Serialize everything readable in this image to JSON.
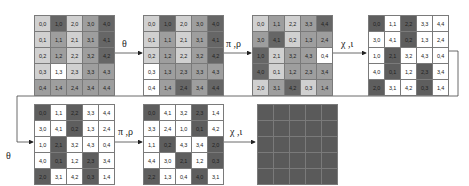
{
  "diagram": {
    "arrows": [
      {
        "label": "θ"
      },
      {
        "label": "π ,ρ"
      },
      {
        "label": "χ ,ι"
      },
      {
        "label": "θ"
      },
      {
        "label": "π ,ρ"
      },
      {
        "label": "χ ,ι"
      }
    ],
    "grids": [
      {
        "name": "state-initial",
        "cells": [
          [
            {
              "t": "0,0",
              "s": "l"
            },
            {
              "t": "1,0",
              "s": "d"
            },
            {
              "t": "2,0",
              "s": "l"
            },
            {
              "t": "3,0",
              "s": "m"
            },
            {
              "t": "4,0",
              "s": "d"
            }
          ],
          [
            {
              "t": "0,1",
              "s": "l"
            },
            {
              "t": "1,1",
              "s": "m"
            },
            {
              "t": "2,1",
              "s": "l"
            },
            {
              "t": "3,1",
              "s": "m"
            },
            {
              "t": "4,1",
              "s": "d"
            }
          ],
          [
            {
              "t": "0,2",
              "s": "l"
            },
            {
              "t": "1,2",
              "s": "m"
            },
            {
              "t": "2,2",
              "s": "l"
            },
            {
              "t": "3,2",
              "s": "m"
            },
            {
              "t": "4,2",
              "s": "d"
            }
          ],
          [
            {
              "t": "0,3",
              "s": "l"
            },
            {
              "t": "1,3",
              "s": "w"
            },
            {
              "t": "2,3",
              "s": "l"
            },
            {
              "t": "3,3",
              "s": "m"
            },
            {
              "t": "4,3",
              "s": "m"
            }
          ],
          [
            {
              "t": "0,4",
              "s": "m"
            },
            {
              "t": "1,4",
              "s": "m"
            },
            {
              "t": "2,4",
              "s": "m"
            },
            {
              "t": "3,4",
              "s": "m"
            },
            {
              "t": "4,4",
              "s": "m"
            }
          ]
        ]
      },
      {
        "name": "state-after-theta",
        "cells": [
          [
            {
              "t": "0,0",
              "s": "l"
            },
            {
              "t": "1,0",
              "s": "d"
            },
            {
              "t": "2,0",
              "s": "l"
            },
            {
              "t": "3,0",
              "s": "m"
            },
            {
              "t": "4,0",
              "s": "d"
            }
          ],
          [
            {
              "t": "0,1",
              "s": "l"
            },
            {
              "t": "1,1",
              "s": "m"
            },
            {
              "t": "2,1",
              "s": "l"
            },
            {
              "t": "3,1",
              "s": "m"
            },
            {
              "t": "4,1",
              "s": "d"
            }
          ],
          [
            {
              "t": "0,2",
              "s": "l"
            },
            {
              "t": "1,2",
              "s": "m"
            },
            {
              "t": "2,2",
              "s": "l"
            },
            {
              "t": "3,2",
              "s": "m"
            },
            {
              "t": "4,2",
              "s": "d"
            }
          ],
          [
            {
              "t": "0,3",
              "s": "w"
            },
            {
              "t": "1,3",
              "s": "m"
            },
            {
              "t": "2,3",
              "s": "m"
            },
            {
              "t": "3,3",
              "s": "m"
            },
            {
              "t": "4,3",
              "s": "m"
            }
          ],
          [
            {
              "t": "0,4",
              "s": "w"
            },
            {
              "t": "1,4",
              "s": "m"
            },
            {
              "t": "2,4",
              "s": "d"
            },
            {
              "t": "3,4",
              "s": "m"
            },
            {
              "t": "4,4",
              "s": "d"
            }
          ]
        ]
      },
      {
        "name": "state-after-pi-rho",
        "cells": [
          [
            {
              "t": "0,0",
              "s": "l"
            },
            {
              "t": "1,1",
              "s": "m"
            },
            {
              "t": "2,2",
              "s": "l"
            },
            {
              "t": "3,3",
              "s": "m"
            },
            {
              "t": "4,4",
              "s": "d"
            }
          ],
          [
            {
              "t": "3,0",
              "s": "m"
            },
            {
              "t": "4,1",
              "s": "d"
            },
            {
              "t": "0,2",
              "s": "l"
            },
            {
              "t": "1,3",
              "s": "m"
            },
            {
              "t": "2,4",
              "s": "m"
            }
          ],
          [
            {
              "t": "1,0",
              "s": "d"
            },
            {
              "t": "2,1",
              "s": "l"
            },
            {
              "t": "3,2",
              "s": "m"
            },
            {
              "t": "4,3",
              "s": "m"
            },
            {
              "t": "0,4",
              "s": "w"
            }
          ],
          [
            {
              "t": "4,0",
              "s": "d"
            },
            {
              "t": "0,1",
              "s": "l"
            },
            {
              "t": "1,2",
              "s": "m"
            },
            {
              "t": "2,3",
              "s": "m"
            },
            {
              "t": "3,4",
              "s": "m"
            }
          ],
          [
            {
              "t": "2,0",
              "s": "l"
            },
            {
              "t": "3,1",
              "s": "m"
            },
            {
              "t": "4,2",
              "s": "d"
            },
            {
              "t": "0,3",
              "s": "l"
            },
            {
              "t": "1,4",
              "s": "m"
            }
          ]
        ]
      },
      {
        "name": "state-after-chi-iota",
        "cells": [
          [
            {
              "t": "0,0",
              "s": "k"
            },
            {
              "t": "1,1",
              "s": "w"
            },
            {
              "t": "2,2",
              "s": "k"
            },
            {
              "t": "3,3",
              "s": "w"
            },
            {
              "t": "4,4",
              "s": "w"
            }
          ],
          [
            {
              "t": "3,0",
              "s": "w"
            },
            {
              "t": "4,1",
              "s": "w"
            },
            {
              "t": "0,2",
              "s": "k"
            },
            {
              "t": "1,3",
              "s": "w"
            },
            {
              "t": "2,4",
              "s": "w"
            }
          ],
          [
            {
              "t": "1,0",
              "s": "w"
            },
            {
              "t": "2,1",
              "s": "k"
            },
            {
              "t": "3,2",
              "s": "w"
            },
            {
              "t": "4,3",
              "s": "w"
            },
            {
              "t": "0,4",
              "s": "w"
            }
          ],
          [
            {
              "t": "4,0",
              "s": "w"
            },
            {
              "t": "0,1",
              "s": "k"
            },
            {
              "t": "1,2",
              "s": "w"
            },
            {
              "t": "2,3",
              "s": "k"
            },
            {
              "t": "3,4",
              "s": "w"
            }
          ],
          [
            {
              "t": "2,0",
              "s": "k"
            },
            {
              "t": "3,1",
              "s": "w"
            },
            {
              "t": "4,2",
              "s": "w"
            },
            {
              "t": "0,3",
              "s": "k"
            },
            {
              "t": "1,4",
              "s": "w"
            }
          ]
        ]
      },
      {
        "name": "state-after-theta-2",
        "cells": [
          [
            {
              "t": "0,0",
              "s": "k"
            },
            {
              "t": "1,1",
              "s": "w"
            },
            {
              "t": "2,2",
              "s": "k"
            },
            {
              "t": "3,3",
              "s": "w"
            },
            {
              "t": "4,4",
              "s": "w"
            }
          ],
          [
            {
              "t": "3,0",
              "s": "w"
            },
            {
              "t": "4,1",
              "s": "w"
            },
            {
              "t": "0,2",
              "s": "k"
            },
            {
              "t": "1,3",
              "s": "w"
            },
            {
              "t": "2,4",
              "s": "w"
            }
          ],
          [
            {
              "t": "1,0",
              "s": "w"
            },
            {
              "t": "2,1",
              "s": "k"
            },
            {
              "t": "3,2",
              "s": "w"
            },
            {
              "t": "4,3",
              "s": "w"
            },
            {
              "t": "0,4",
              "s": "w"
            }
          ],
          [
            {
              "t": "4,0",
              "s": "w"
            },
            {
              "t": "0,1",
              "s": "k"
            },
            {
              "t": "1,2",
              "s": "w"
            },
            {
              "t": "2,3",
              "s": "k"
            },
            {
              "t": "3,4",
              "s": "w"
            }
          ],
          [
            {
              "t": "2,0",
              "s": "k"
            },
            {
              "t": "3,1",
              "s": "w"
            },
            {
              "t": "4,2",
              "s": "w"
            },
            {
              "t": "0,3",
              "s": "k"
            },
            {
              "t": "1,4",
              "s": "w"
            }
          ]
        ]
      },
      {
        "name": "state-after-pi-rho-2",
        "cells": [
          [
            {
              "t": "0,0",
              "s": "k"
            },
            {
              "t": "4,1",
              "s": "w"
            },
            {
              "t": "3,2",
              "s": "w"
            },
            {
              "t": "2,3",
              "s": "k"
            },
            {
              "t": "1,4",
              "s": "w"
            }
          ],
          [
            {
              "t": "3,3",
              "s": "w"
            },
            {
              "t": "2,4",
              "s": "w"
            },
            {
              "t": "1,0",
              "s": "w"
            },
            {
              "t": "0,1",
              "s": "k"
            },
            {
              "t": "4,2",
              "s": "w"
            }
          ],
          [
            {
              "t": "1,1",
              "s": "w"
            },
            {
              "t": "0,2",
              "s": "k"
            },
            {
              "t": "4,3",
              "s": "w"
            },
            {
              "t": "3,4",
              "s": "w"
            },
            {
              "t": "2,0",
              "s": "k"
            }
          ],
          [
            {
              "t": "4,4",
              "s": "w"
            },
            {
              "t": "3,0",
              "s": "w"
            },
            {
              "t": "2,1",
              "s": "k"
            },
            {
              "t": "1,2",
              "s": "w"
            },
            {
              "t": "0,3",
              "s": "k"
            }
          ],
          [
            {
              "t": "2,2",
              "s": "k"
            },
            {
              "t": "1,3",
              "s": "w"
            },
            {
              "t": "0,4",
              "s": "w"
            },
            {
              "t": "4,0",
              "s": "k"
            },
            {
              "t": "3,1",
              "s": "w"
            }
          ]
        ]
      },
      {
        "name": "state-final",
        "cells": [
          [
            {
              "t": "",
              "s": "b"
            },
            {
              "t": "",
              "s": "b"
            },
            {
              "t": "",
              "s": "b"
            },
            {
              "t": "",
              "s": "b"
            },
            {
              "t": "",
              "s": "b"
            }
          ],
          [
            {
              "t": "",
              "s": "b"
            },
            {
              "t": "",
              "s": "b"
            },
            {
              "t": "",
              "s": "b"
            },
            {
              "t": "",
              "s": "b"
            },
            {
              "t": "",
              "s": "b"
            }
          ],
          [
            {
              "t": "",
              "s": "b"
            },
            {
              "t": "",
              "s": "b"
            },
            {
              "t": "",
              "s": "b"
            },
            {
              "t": "",
              "s": "b"
            },
            {
              "t": "",
              "s": "b"
            }
          ],
          [
            {
              "t": "",
              "s": "b"
            },
            {
              "t": "",
              "s": "b"
            },
            {
              "t": "",
              "s": "b"
            },
            {
              "t": "",
              "s": "b"
            },
            {
              "t": "",
              "s": "b"
            }
          ],
          [
            {
              "t": "",
              "s": "b"
            },
            {
              "t": "",
              "s": "b"
            },
            {
              "t": "",
              "s": "b"
            },
            {
              "t": "",
              "s": "b"
            },
            {
              "t": "",
              "s": "b"
            }
          ]
        ]
      }
    ]
  }
}
